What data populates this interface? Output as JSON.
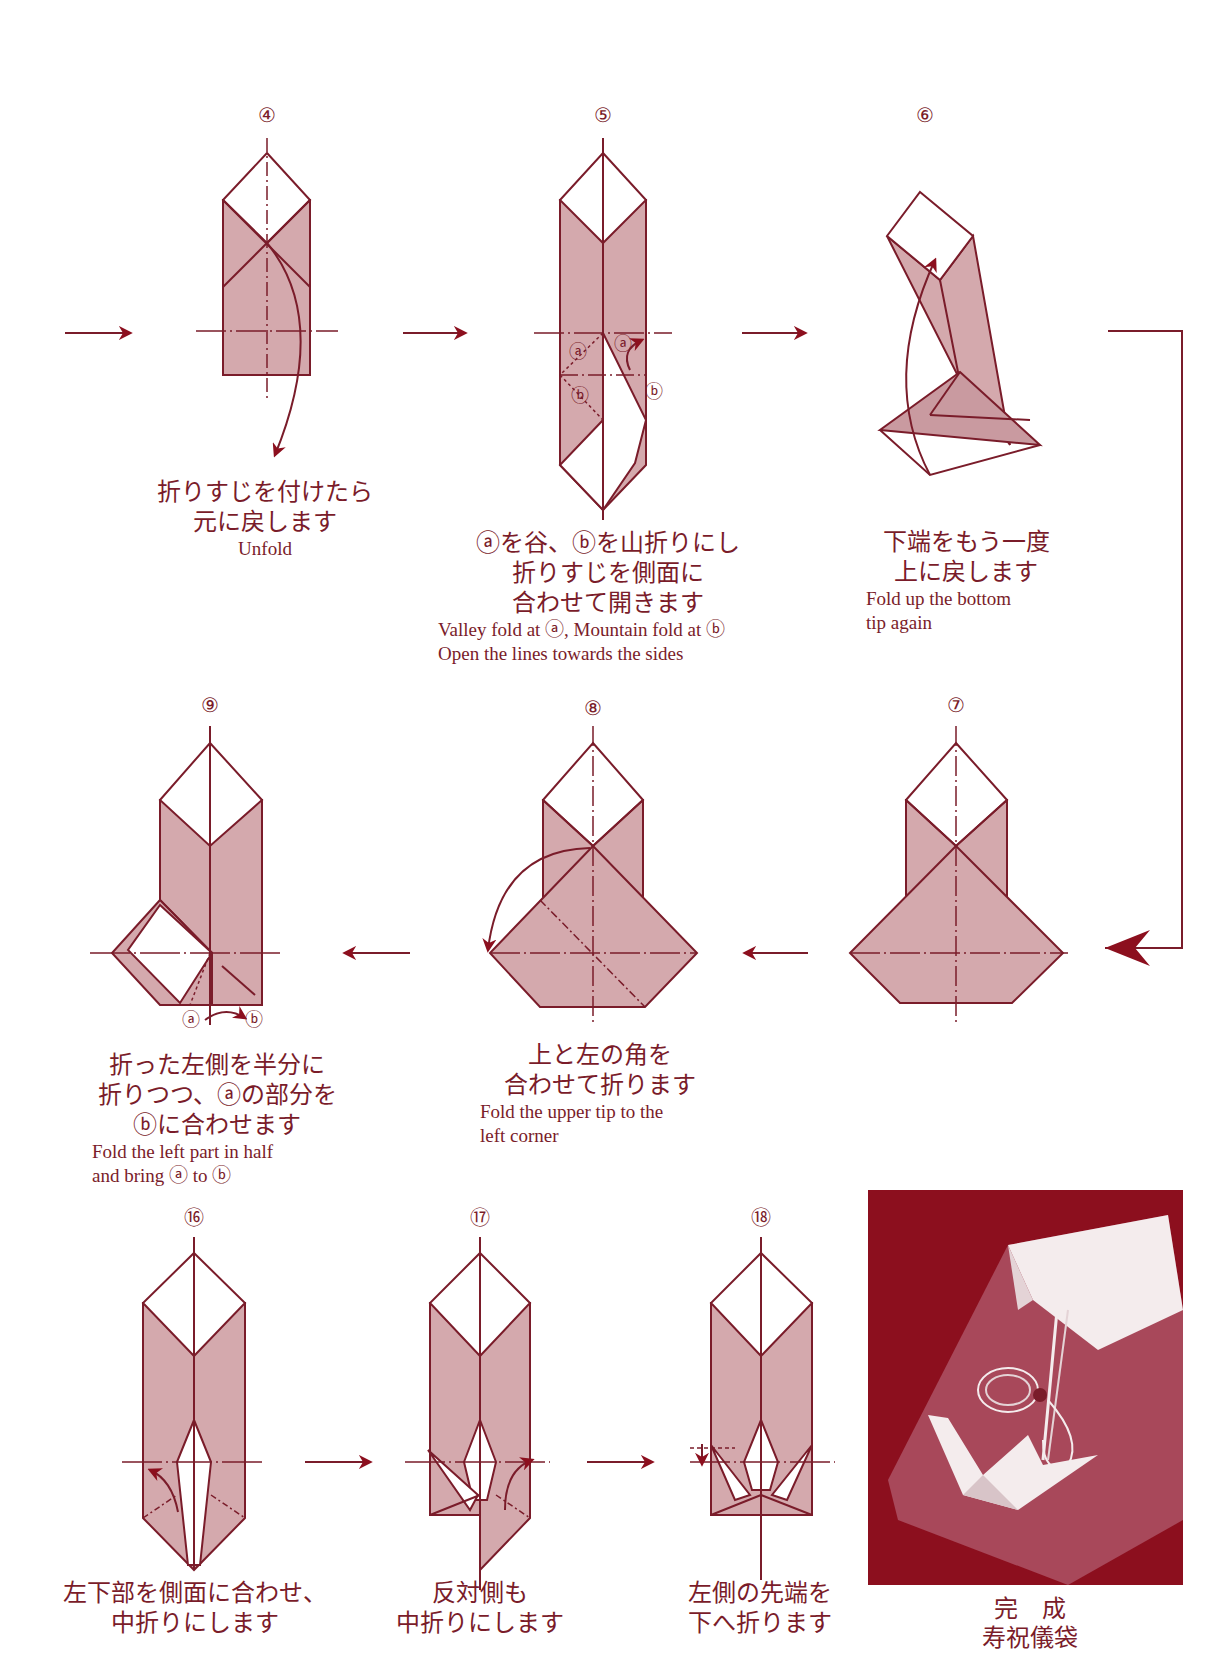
{
  "page": {
    "colors": {
      "line": "#7a1c2a",
      "fill": "#d4a9ad",
      "accent": "#8c0f1e",
      "background": "#ffffff"
    }
  },
  "steps": [
    {
      "number": "④",
      "jp_lines": [
        "折りすじを付けたら",
        "元に戻します"
      ],
      "en_lines": [
        "Unfold"
      ]
    },
    {
      "number": "⑤",
      "jp_lines": [
        "ⓐを谷、ⓑを山折りにし",
        "折りすじを側面に",
        "合わせて開きます"
      ],
      "en_lines": [
        "Valley fold at ⓐ,  Mountain fold at ⓑ",
        "Open the  lines towards the sides"
      ],
      "labels": [
        "ⓐ",
        "ⓐ",
        "ⓑ",
        "ⓑ"
      ]
    },
    {
      "number": "⑥",
      "jp_lines": [
        "下端をもう一度",
        "上に戻します"
      ],
      "en_lines": [
        "Fold up the bottom",
        "tip again"
      ]
    },
    {
      "number": "⑦",
      "jp_lines": [],
      "en_lines": []
    },
    {
      "number": "⑧",
      "jp_lines": [
        "上と左の角を",
        "合わせて折ります"
      ],
      "en_lines": [
        "Fold the upper tip to the",
        "left corner"
      ]
    },
    {
      "number": "⑨",
      "jp_lines": [
        "折った左側を半分に",
        "折りつつ、ⓐの部分を",
        "ⓑに合わせます"
      ],
      "en_lines": [
        "Fold the left part in half",
        "and bring ⓐ to ⓑ"
      ],
      "labels": [
        "ⓐ",
        "ⓑ"
      ]
    },
    {
      "number": "⑯",
      "jp_lines": [
        "左下部を側面に合わせ、",
        "中折りにします"
      ],
      "en_lines": []
    },
    {
      "number": "⑰",
      "jp_lines": [
        "反対側も",
        "中折りにします"
      ],
      "en_lines": []
    },
    {
      "number": "⑱",
      "jp_lines": [
        "左側の先端を",
        "下へ折ります"
      ],
      "en_lines": []
    }
  ],
  "final": {
    "title": "完　成",
    "subtitle": "寿祝儀袋",
    "photo_alt": "folded-envelope-with-crane-photo"
  }
}
